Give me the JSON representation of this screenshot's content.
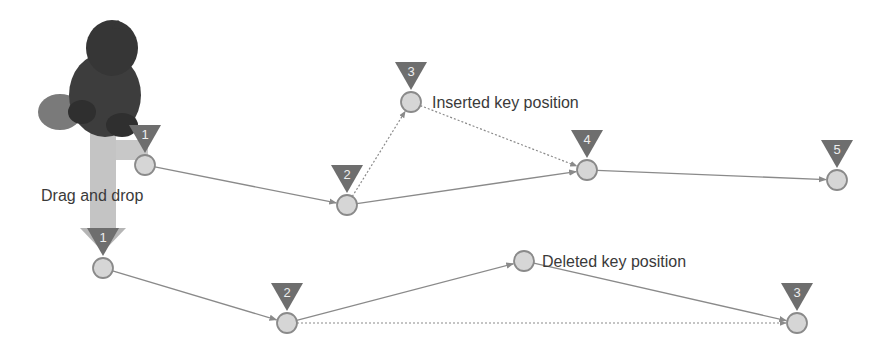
{
  "diagram": {
    "title": "",
    "colors": {
      "background": "#ffffff",
      "marker": "#6e6e6e",
      "node_fill": "#d6d6d6",
      "node_stroke": "#8a8a8a",
      "edge": "#8a8a8a",
      "drag_arrow": "#c4c4c4",
      "object": "#3d3d3d",
      "text": "#3a3a3a"
    },
    "labels": {
      "drag": "Drag and drop",
      "inserted": "Inserted key position",
      "deleted": "Deleted key position"
    },
    "top_path": {
      "nodes": [
        {
          "id": "t1",
          "marker": "1",
          "x": 145,
          "y": 165
        },
        {
          "id": "t2",
          "marker": "2",
          "x": 347,
          "y": 205
        },
        {
          "id": "t3",
          "marker": "3",
          "x": 411,
          "y": 102,
          "note": "inserted"
        },
        {
          "id": "t4",
          "marker": "4",
          "x": 587,
          "y": 170
        },
        {
          "id": "t5",
          "marker": "5",
          "x": 837,
          "y": 180
        }
      ],
      "edges": [
        {
          "from": "t1",
          "to": "t2",
          "style": "solid"
        },
        {
          "from": "t2",
          "to": "t3",
          "style": "dotted"
        },
        {
          "from": "t3",
          "to": "t4",
          "style": "dotted"
        },
        {
          "from": "t2",
          "to": "t4",
          "style": "solid"
        },
        {
          "from": "t4",
          "to": "t5",
          "style": "solid"
        }
      ]
    },
    "bottom_path": {
      "nodes": [
        {
          "id": "b1",
          "marker": "1",
          "x": 103,
          "y": 268
        },
        {
          "id": "b2",
          "marker": "2",
          "x": 287,
          "y": 323
        },
        {
          "id": "bd",
          "marker": "",
          "x": 524,
          "y": 261,
          "note": "deleted"
        },
        {
          "id": "b3",
          "marker": "3",
          "x": 797,
          "y": 323
        }
      ],
      "edges": [
        {
          "from": "b1",
          "to": "b2",
          "style": "solid"
        },
        {
          "from": "b2",
          "to": "bd",
          "style": "solid"
        },
        {
          "from": "bd",
          "to": "b3",
          "style": "solid"
        },
        {
          "from": "b2",
          "to": "b3",
          "style": "dotted"
        }
      ]
    }
  }
}
